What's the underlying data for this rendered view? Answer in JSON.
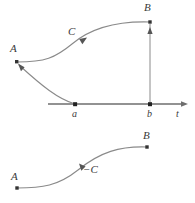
{
  "figure": {
    "stroke_color": "#6e6e6e",
    "point_color": "#333333",
    "label_color": "#3a3a3a",
    "background": "#ffffff"
  },
  "top_panel": {
    "labels": {
      "curve_c": "C",
      "point_a_upper": "A",
      "point_b_upper": "B",
      "tick_a": "a",
      "tick_b": "b",
      "axis_t": "t"
    },
    "points": {
      "A": {
        "x": 17,
        "y": 62
      },
      "B": {
        "x": 150,
        "y": 22
      },
      "a": {
        "x": 75,
        "y": 104
      },
      "b": {
        "x": 150,
        "y": 104
      }
    },
    "axis": {
      "y": 104,
      "x_start": 48,
      "x_end": 188,
      "arrow": "right"
    },
    "vertical_segment": {
      "x": 150,
      "y_from": 104,
      "y_to": 22,
      "arrow": "up"
    },
    "curve_path": "M17,62 C45,62 55,58 72,44 C92,27 118,21 150,22",
    "mapping_path": "M75,104 C58,99 42,86 19,65",
    "curve_arrow": {
      "x": 85,
      "y": 39,
      "angle": -38
    },
    "mapping_arrow": {
      "x": 21,
      "y": 67,
      "angle": -138
    }
  },
  "bottom_panel": {
    "labels": {
      "curve_minus_c": "−C",
      "point_a_lower": "A",
      "point_b_lower": "B"
    },
    "points": {
      "A": {
        "x": 17,
        "y": 188
      },
      "B": {
        "x": 147,
        "y": 147
      }
    },
    "curve_path": "M17,188 C42,188 58,186 78,170 C100,152 120,146 147,147",
    "curve_arrow": {
      "x": 81,
      "y": 166,
      "angle": -140
    }
  }
}
